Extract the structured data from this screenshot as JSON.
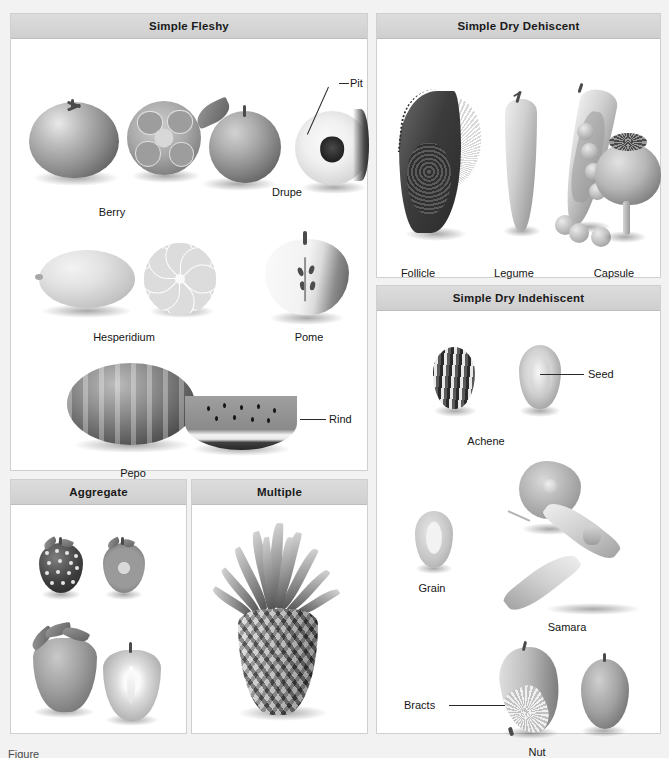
{
  "figure": {
    "background_color": "#f2f2f2",
    "header_color": "#d4d4d4",
    "panel_border_color": "#cfcfcf",
    "text_color": "#161616"
  },
  "panels": [
    {
      "id": "simple-fleshy",
      "title": "Simple Fleshy",
      "specimens": [
        {
          "name": "Berry",
          "views": [
            "whole tomato",
            "cross section with locules and seeds"
          ]
        },
        {
          "name": "Drupe",
          "views": [
            "whole peach with leaf",
            "cut peach showing pit"
          ]
        },
        {
          "name": "Hesperidium",
          "views": [
            "whole lemon",
            "cross section showing segments"
          ]
        },
        {
          "name": "Pome",
          "views": [
            "apple cut longitudinally showing core"
          ]
        },
        {
          "name": "Pepo",
          "views": [
            "whole watermelon",
            "wedge slice showing rind and seeds"
          ]
        }
      ],
      "callouts": [
        {
          "label": "Pit",
          "target": "drupe stone"
        },
        {
          "label": "Rind",
          "target": "watermelon outer rind"
        }
      ]
    },
    {
      "id": "simple-dry-dehiscent",
      "title": "Simple Dry Dehiscent",
      "specimens": [
        {
          "name": "Follicle",
          "views": [
            "milkweed follicle splitting open with silky floss and seeds"
          ]
        },
        {
          "name": "Legume",
          "views": [
            "closed pea pod",
            "split pea pod with loose peas"
          ]
        },
        {
          "name": "Capsule",
          "views": [
            "poppy capsule with stigmatic disc crown"
          ]
        }
      ],
      "callouts": []
    },
    {
      "id": "simple-dry-indehiscent",
      "title": "Simple Dry Indehiscent",
      "specimens": [
        {
          "name": "Achene",
          "views": [
            "striped sunflower achene",
            "sectioned achene showing seed"
          ]
        },
        {
          "name": "Grain",
          "views": [
            "single cereal grain"
          ]
        },
        {
          "name": "Samara",
          "views": [
            "elm-type winged samara",
            "paired maple samara"
          ]
        },
        {
          "name": "Nut",
          "views": [
            "acorn with bract cup",
            "bare nut"
          ]
        }
      ],
      "callouts": [
        {
          "label": "Seed",
          "target": "achene interior seed"
        },
        {
          "label": "Bracts",
          "target": "acorn cup bracts"
        }
      ]
    },
    {
      "id": "aggregate",
      "title": "Aggregate",
      "specimens": [
        {
          "name": "Blackberry",
          "views": [
            "whole blackberry",
            "cut blackberry"
          ]
        },
        {
          "name": "Strawberry",
          "views": [
            "whole strawberry with calyx",
            "halved strawberry"
          ]
        }
      ],
      "callouts": []
    },
    {
      "id": "multiple",
      "title": "Multiple",
      "specimens": [
        {
          "name": "Pineapple",
          "views": [
            "whole pineapple with crown of leaves"
          ]
        }
      ],
      "callouts": []
    }
  ],
  "labels": {
    "berry": "Berry",
    "drupe": "Drupe",
    "pit": "Pit",
    "hesperidium": "Hesperidium",
    "pome": "Pome",
    "pepo": "Pepo",
    "rind": "Rind",
    "follicle": "Follicle",
    "legume": "Legume",
    "capsule": "Capsule",
    "achene": "Achene",
    "seed": "Seed",
    "grain": "Grain",
    "samara": "Samara",
    "bracts": "Bracts",
    "nut": "Nut",
    "aggregate": "Aggregate",
    "multiple": "Multiple",
    "simple_fleshy": "Simple Fleshy",
    "simple_dry_dehiscent": "Simple Dry Dehiscent",
    "simple_dry_indehiscent": "Simple Dry Indehiscent"
  },
  "caption": "Figure"
}
